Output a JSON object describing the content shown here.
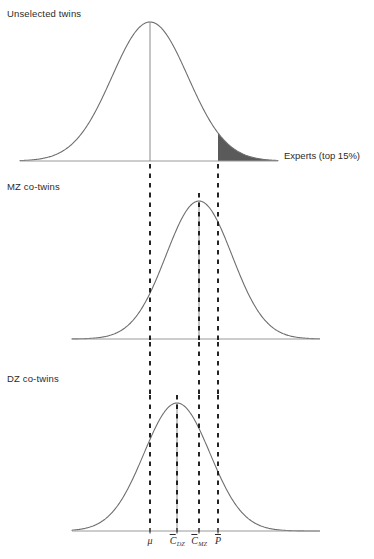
{
  "figure": {
    "width": 374,
    "height": 559,
    "background": "#ffffff",
    "curve_color": "#6e6e6e",
    "axis_color": "#9a9a9a",
    "dash_color": "#1a1a1a",
    "shade_color": "#5a5a5a",
    "text_color": "#2b2b2b"
  },
  "panels": {
    "unselected": {
      "label": "Unselected twins"
    },
    "mz": {
      "label": "MZ co-twins"
    },
    "dz": {
      "label": "DZ co-twins"
    }
  },
  "annotations": {
    "experts": "Experts (top 15%)"
  },
  "tick_labels": {
    "mu": "μ",
    "c_dz_base": "C",
    "c_dz_sub": "DZ",
    "c_mz_base": "C",
    "c_mz_sub": "MZ",
    "p_bar": "P"
  },
  "chart_data": {
    "type": "line",
    "title": "",
    "xlabel": "",
    "ylabel": "",
    "grid": false,
    "legend_position": "none",
    "reference_lines": [
      {
        "name": "mu",
        "label": "μ",
        "x_px": 150,
        "panels": [
          "unselected",
          "mz",
          "dz"
        ],
        "style": "dashed"
      },
      {
        "name": "c_dz",
        "label": "C_DZ",
        "x_px": 177,
        "panels": [
          "dz"
        ],
        "style": "dashed"
      },
      {
        "name": "c_mz",
        "label": "C_MZ",
        "x_px": 199,
        "panels": [
          "mz",
          "dz"
        ],
        "style": "dashed"
      },
      {
        "name": "p_bar",
        "label": "P̄",
        "x_px": 218,
        "panels": [
          "unselected",
          "mz",
          "dz"
        ],
        "style": "dashed"
      }
    ],
    "series": [
      {
        "name": "Unselected twins",
        "panel": "unselected",
        "distribution": "normal",
        "mean_px": 150,
        "sigma_px": 38,
        "peak_height_px": 139,
        "baseline_y_px": 161,
        "axis_x_start_px": 20,
        "axis_x_end_px": 278,
        "mean_marker": true,
        "shaded_tail": {
          "from_x_px": 218,
          "to_x_px": 278,
          "side": "right",
          "label": "Experts (top 15%)",
          "proportion": 0.15,
          "color": "#5a5a5a"
        }
      },
      {
        "name": "MZ co-twins",
        "panel": "mz",
        "distribution": "normal",
        "mean_px": 199,
        "sigma_px": 33,
        "peak_height_px": 138,
        "baseline_y_px": 339,
        "axis_x_start_px": 72,
        "axis_x_end_px": 320,
        "mean_marker": true,
        "shaded_tail": null
      },
      {
        "name": "DZ co-twins",
        "panel": "dz",
        "distribution": "normal",
        "mean_px": 177,
        "sigma_px": 33,
        "peak_height_px": 128,
        "baseline_y_px": 531,
        "axis_x_start_px": 72,
        "axis_x_end_px": 320,
        "mean_marker": true,
        "shaded_tail": null
      }
    ],
    "axis_ticks": [
      {
        "label": "μ",
        "x_px": 150
      },
      {
        "label": "C_DZ",
        "x_px": 177
      },
      {
        "label": "C_MZ",
        "x_px": 199
      },
      {
        "label": "P̄",
        "x_px": 218
      }
    ]
  }
}
